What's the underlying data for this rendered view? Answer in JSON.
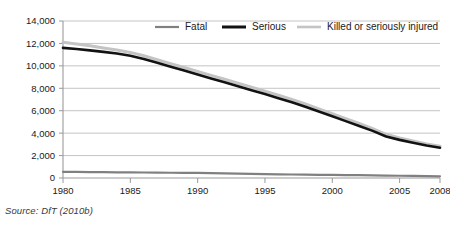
{
  "source_note": "Source: DfT (2010b)",
  "chart_data": {
    "type": "line",
    "title": "",
    "subtitle": "",
    "xlabel": "",
    "ylabel": "",
    "x": [
      1980,
      1981,
      1982,
      1983,
      1984,
      1985,
      1986,
      1987,
      1988,
      1989,
      1990,
      1991,
      1992,
      1993,
      1994,
      1995,
      1996,
      1997,
      1998,
      1999,
      2000,
      2001,
      2002,
      2003,
      2004,
      2005,
      2006,
      2007,
      2008
    ],
    "xlim": [
      1980,
      2008
    ],
    "ylim": [
      0,
      14000
    ],
    "xticks": [
      1980,
      1985,
      1990,
      1995,
      2000,
      2005,
      2008
    ],
    "xtick_labels": [
      "1980",
      "1985",
      "1990",
      "1995",
      "2000",
      "2005",
      "2008"
    ],
    "yticks": [
      0,
      2000,
      4000,
      6000,
      8000,
      10000,
      12000,
      14000
    ],
    "ytick_labels": [
      "0",
      "2,000",
      "4,000",
      "6,000",
      "8,000",
      "10,000",
      "12,000",
      "14,000"
    ],
    "grid": "horizontal",
    "legend_position": "top",
    "series": [
      {
        "name": "Fatal",
        "color": "#808080",
        "width": 2.2,
        "values": [
          550,
          540,
          530,
          520,
          510,
          500,
          490,
          480,
          470,
          460,
          450,
          430,
          410,
          390,
          370,
          350,
          330,
          310,
          295,
          280,
          270,
          260,
          250,
          230,
          215,
          200,
          185,
          170,
          150
        ]
      },
      {
        "name": "Serious",
        "color": "#121212",
        "width": 2.6,
        "values": [
          11600,
          11500,
          11380,
          11250,
          11100,
          10900,
          10620,
          10280,
          9930,
          9580,
          9230,
          8880,
          8530,
          8180,
          7830,
          7480,
          7120,
          6750,
          6350,
          5930,
          5500,
          5070,
          4640,
          4200,
          3700,
          3400,
          3150,
          2900,
          2700
        ]
      },
      {
        "name": "Killed or seriously injured",
        "color": "#c4c4c4",
        "width": 3.0,
        "values": [
          12100,
          11950,
          11800,
          11600,
          11420,
          11200,
          10900,
          10550,
          10200,
          9850,
          9500,
          9150,
          8800,
          8450,
          8100,
          7750,
          7380,
          7000,
          6600,
          6170,
          5740,
          5300,
          4860,
          4410,
          3900,
          3580,
          3310,
          3040,
          2830
        ]
      }
    ],
    "legend": [
      {
        "label": "Fatal",
        "color": "#808080",
        "width": 2.2
      },
      {
        "label": "Serious",
        "color": "#121212",
        "width": 3.0
      },
      {
        "label": "Killed or seriously injured",
        "color": "#c4c4c4",
        "width": 2.6
      }
    ]
  }
}
